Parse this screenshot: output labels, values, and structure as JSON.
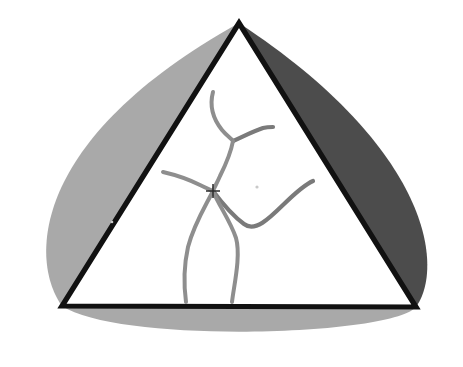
{
  "figure": {
    "title": "Triangular indentation with three curved lobes",
    "background_color": "#ffffff",
    "width": 463,
    "height": 367,
    "colors": {
      "lobe_light": "#a9a9a9",
      "lobe_dark": "#4c4c4c",
      "triangle_edge": "#111111",
      "triangle_interior": "#ffffff",
      "grain_line": "#8e8e8e",
      "marker": "#2b2b2b"
    },
    "triangle": {
      "name": "central-triangle",
      "apex": [
        239,
        23
      ],
      "bottom_left": [
        62,
        306
      ],
      "bottom_right": [
        416,
        307
      ],
      "edge_width": 5.2
    },
    "lobes": [
      {
        "name": "upper-left-lobe",
        "shade": "light",
        "color": "#a9a9a9",
        "along_edge": "apex-to-bottom-left",
        "bulge_direction": "outward-left",
        "outer_extent": [
          27,
          281
        ]
      },
      {
        "name": "upper-right-lobe",
        "shade": "dark",
        "color": "#4c4c4c",
        "along_edge": "apex-to-bottom-right",
        "bulge_direction": "outward-right",
        "outer_extent": [
          441,
          248
        ]
      },
      {
        "name": "bottom-lobe",
        "shade": "light",
        "color": "#a9a9a9",
        "along_edge": "bottom-left-to-bottom-right",
        "bulge_direction": "outward-down",
        "outer_extent": [
          239,
          341
        ]
      }
    ],
    "marker": {
      "name": "center-crosshair",
      "type": "crosshair",
      "position": [
        213,
        191
      ],
      "arm_length": 7
    },
    "grain_lines": [
      {
        "name": "grain-line-upper-left",
        "from": [
          214,
          92
        ],
        "to": [
          233,
          141
        ],
        "note": "descends from upper-left triangle edge to upper junction"
      },
      {
        "name": "grain-line-upper-right-branch",
        "from": [
          233,
          141
        ],
        "to": [
          272,
          127
        ],
        "note": "branches up-right from upper junction to right edge"
      },
      {
        "name": "grain-line-center-spine",
        "from": [
          233,
          141
        ],
        "to": [
          213,
          191
        ],
        "note": "upper junction down to the crosshair node"
      },
      {
        "name": "grain-line-left-arm",
        "from": [
          163,
          172
        ],
        "to": [
          213,
          191
        ],
        "note": "from left triangle edge into the crosshair node"
      },
      {
        "name": "grain-line-lower-right-arm",
        "from": [
          213,
          191
        ],
        "to": [
          313,
          181
        ],
        "note": "from crosshair node curving right to the right triangle edge"
      },
      {
        "name": "grain-line-lower-left-drop",
        "from": [
          213,
          191
        ],
        "to": [
          186,
          302
        ],
        "note": "from crosshair node down to the bottom edge"
      },
      {
        "name": "grain-line-lower-right-drop",
        "from": [
          213,
          191
        ],
        "to": [
          232,
          302
        ],
        "note": "from crosshair node down to the bottom edge"
      }
    ],
    "specks": [
      {
        "name": "speck-right-of-marker",
        "position": [
          257,
          187
        ]
      },
      {
        "name": "speck-left-mid",
        "position": [
          112,
          222
        ]
      }
    ]
  }
}
